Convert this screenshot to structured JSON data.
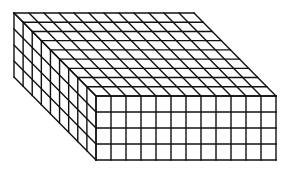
{
  "figure": {
    "columns": 12,
    "rows": 4,
    "depth": 9,
    "front": {
      "x": 96,
      "y": 96,
      "cell_w": 15,
      "cell_h": 16
    },
    "depth_offset": {
      "dx": -82,
      "dy": -83
    },
    "stroke_color": "#111111",
    "background": "#ffffff"
  }
}
